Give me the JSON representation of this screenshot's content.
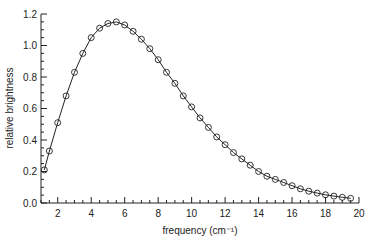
{
  "chart_data": {
    "type": "line",
    "title": "",
    "xlabel": "frequency (cm⁻¹)",
    "ylabel": "relative brightness",
    "xlim": [
      1,
      20
    ],
    "ylim": [
      0,
      1.2
    ],
    "x_ticks": [
      2,
      4,
      6,
      8,
      10,
      12,
      14,
      16,
      18,
      20
    ],
    "y_ticks": [
      0.0,
      0.2,
      0.4,
      0.6,
      0.8,
      1.0,
      1.2
    ],
    "y_tick_labels": [
      "0.0",
      "0.2",
      "0.4",
      "0.6",
      "0.8",
      "1.0",
      "1.2"
    ],
    "grid": false,
    "legend": null,
    "series": [
      {
        "name": "measured spectrum (circles) with fitted curve",
        "marker": "open-circle",
        "x": [
          1.2,
          1.5,
          2.0,
          2.5,
          3.0,
          3.5,
          4.0,
          4.5,
          5.0,
          5.5,
          6.0,
          6.5,
          7.0,
          7.5,
          8.0,
          8.5,
          9.0,
          9.5,
          10.0,
          10.5,
          11.0,
          11.5,
          12.0,
          12.5,
          13.0,
          13.5,
          14.0,
          14.5,
          15.0,
          15.5,
          16.0,
          16.5,
          17.0,
          17.5,
          18.0,
          18.5,
          19.0,
          19.5
        ],
        "values": [
          0.21,
          0.33,
          0.51,
          0.68,
          0.83,
          0.95,
          1.05,
          1.11,
          1.14,
          1.15,
          1.13,
          1.09,
          1.04,
          0.98,
          0.91,
          0.83,
          0.76,
          0.68,
          0.61,
          0.54,
          0.48,
          0.42,
          0.37,
          0.32,
          0.28,
          0.24,
          0.2,
          0.17,
          0.15,
          0.13,
          0.11,
          0.09,
          0.075,
          0.063,
          0.052,
          0.044,
          0.036,
          0.03
        ]
      }
    ]
  }
}
